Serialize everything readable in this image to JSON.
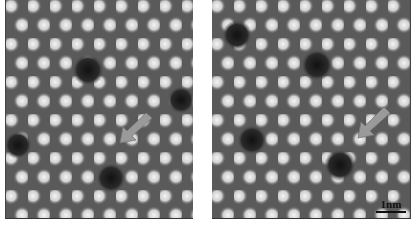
{
  "figure": {
    "panels": [
      {
        "id": "left",
        "description": "STM atomic-resolution image with dark vacancy defects",
        "arrow": {
          "x": 120,
          "y": 130,
          "direction": "down-left",
          "color": "#9a9a9a"
        }
      },
      {
        "id": "right",
        "description": "STM atomic-resolution image after change, arrow pointing to new dark site",
        "arrow": {
          "x": 150,
          "y": 135,
          "direction": "down-left",
          "color": "#9a9a9a"
        }
      }
    ],
    "scale_bar": {
      "label": "1nm"
    }
  }
}
